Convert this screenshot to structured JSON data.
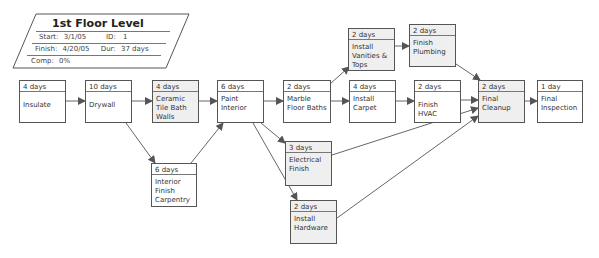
{
  "summary": {
    "title": "1st Floor Level",
    "start_label": "Start:",
    "start_value": "3/1/05",
    "id_label": "ID:",
    "id_value": "1",
    "finish_label": "Finish:",
    "finish_value": "4/20/05",
    "dur_label": "Dur:",
    "dur_value": "37 days",
    "comp_label": "Comp:",
    "comp_value": "0%"
  },
  "tasks": [
    {
      "key": "insulate",
      "duration": "4 days",
      "name": "Insulate",
      "x": 19,
      "y": 80,
      "w": 47,
      "h": 43,
      "grey": false
    },
    {
      "key": "drywall",
      "duration": "10 days",
      "name": "Drywall",
      "x": 85,
      "y": 80,
      "w": 47,
      "h": 43,
      "grey": false
    },
    {
      "key": "ceramic",
      "duration": "4 days",
      "name": "Ceramic\nTile Bath\nWalls",
      "x": 152,
      "y": 80,
      "w": 47,
      "h": 43,
      "grey": true
    },
    {
      "key": "paint",
      "duration": "6 days",
      "name": "Paint\nInterior",
      "x": 217,
      "y": 80,
      "w": 47,
      "h": 43,
      "grey": false
    },
    {
      "key": "marble",
      "duration": "2 days",
      "name": "Marble\nFloor Baths",
      "x": 283,
      "y": 80,
      "w": 48,
      "h": 43,
      "grey": false
    },
    {
      "key": "carpet",
      "duration": "4 days",
      "name": "Install\nCarpet",
      "x": 349,
      "y": 80,
      "w": 47,
      "h": 43,
      "grey": false
    },
    {
      "key": "hvac",
      "duration": "2 days",
      "name": "Finish HVAC",
      "x": 414,
      "y": 80,
      "w": 47,
      "h": 43,
      "grey": false
    },
    {
      "key": "cleanup",
      "duration": "2 days",
      "name": "Final\nCleanup",
      "x": 478,
      "y": 80,
      "w": 47,
      "h": 43,
      "grey": true
    },
    {
      "key": "inspection",
      "duration": "1 day",
      "name": "Final\nInspection",
      "x": 537,
      "y": 80,
      "w": 46,
      "h": 43,
      "grey": false
    },
    {
      "key": "vanities",
      "duration": "2 days",
      "name": "Install\nVanities &\nTops",
      "x": 348,
      "y": 28,
      "w": 47,
      "h": 43,
      "grey": true
    },
    {
      "key": "plumbing",
      "duration": "2 days",
      "name": "Finish\nPlumbing",
      "x": 409,
      "y": 24,
      "w": 47,
      "h": 43,
      "grey": true
    },
    {
      "key": "interior",
      "duration": "6 days",
      "name": "Interior\nFinish\nCarpentry",
      "x": 151,
      "y": 163,
      "w": 46,
      "h": 44,
      "grey": false
    },
    {
      "key": "electrical",
      "duration": "3 days",
      "name": "Electrical\nFinish",
      "x": 285,
      "y": 141,
      "w": 47,
      "h": 45,
      "grey": true
    },
    {
      "key": "hardware",
      "duration": "2 days",
      "name": "Install\nHardware",
      "x": 290,
      "y": 200,
      "w": 47,
      "h": 44,
      "grey": true
    }
  ],
  "links": [
    {
      "from": "insulate",
      "to": "drywall",
      "x1": 66,
      "y1": 101,
      "x2": 85,
      "y2": 101
    },
    {
      "from": "drywall",
      "to": "ceramic",
      "x1": 132,
      "y1": 101,
      "x2": 152,
      "y2": 101
    },
    {
      "from": "drywall",
      "to": "interior",
      "x1": 126,
      "y1": 123,
      "x2": 155,
      "y2": 163
    },
    {
      "from": "ceramic",
      "to": "paint",
      "x1": 199,
      "y1": 101,
      "x2": 217,
      "y2": 101
    },
    {
      "from": "interior",
      "to": "paint",
      "x1": 191,
      "y1": 163,
      "x2": 223,
      "y2": 123
    },
    {
      "from": "paint",
      "to": "marble",
      "x1": 264,
      "y1": 101,
      "x2": 283,
      "y2": 101
    },
    {
      "from": "paint",
      "to": "electrical",
      "x1": 261,
      "y1": 123,
      "x2": 285,
      "y2": 143
    },
    {
      "from": "paint",
      "to": "hardware",
      "x1": 253,
      "y1": 123,
      "x2": 297,
      "y2": 200
    },
    {
      "from": "marble",
      "to": "vanities",
      "x1": 330,
      "y1": 84,
      "x2": 349,
      "y2": 67
    },
    {
      "from": "marble",
      "to": "carpet",
      "x1": 331,
      "y1": 101,
      "x2": 349,
      "y2": 101
    },
    {
      "from": "vanities",
      "to": "plumbing",
      "x1": 395,
      "y1": 46,
      "x2": 409,
      "y2": 46
    },
    {
      "from": "carpet",
      "to": "hvac",
      "x1": 396,
      "y1": 101,
      "x2": 414,
      "y2": 101
    },
    {
      "from": "plumbing",
      "to": "cleanup",
      "x1": 456,
      "y1": 64,
      "x2": 480,
      "y2": 80
    },
    {
      "from": "hvac",
      "to": "cleanup",
      "x1": 461,
      "y1": 100,
      "x2": 478,
      "y2": 100
    },
    {
      "from": "electrical",
      "to": "cleanup",
      "x1": 332,
      "y1": 155,
      "x2": 478,
      "y2": 108
    },
    {
      "from": "hardware",
      "to": "cleanup",
      "x1": 337,
      "y1": 218,
      "x2": 478,
      "y2": 116
    },
    {
      "from": "cleanup",
      "to": "inspection",
      "x1": 525,
      "y1": 101,
      "x2": 537,
      "y2": 101
    }
  ]
}
